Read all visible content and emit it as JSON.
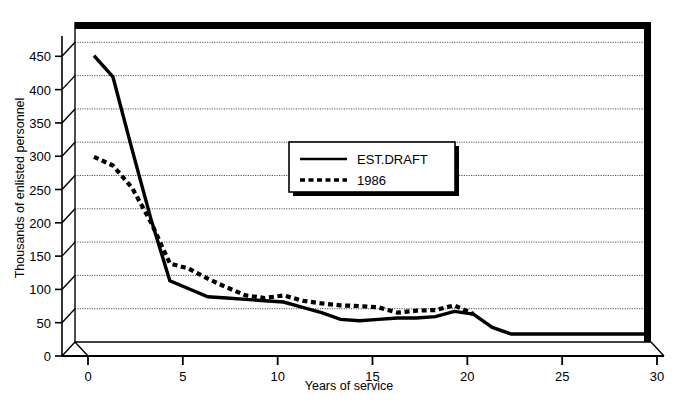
{
  "chart_data": {
    "type": "line",
    "title": "",
    "xlabel": "Years of service",
    "ylabel": "Thousands of enlisted personnel",
    "xlim": [
      0,
      30
    ],
    "ylim": [
      0,
      470
    ],
    "xticks": [
      "0",
      "5",
      "10",
      "15",
      "20",
      "25",
      "30"
    ],
    "yticks": [
      "0",
      "50",
      "100",
      "150",
      "200",
      "250",
      "300",
      "350",
      "400",
      "450"
    ],
    "grid": "horizontal",
    "legend_position": "upper-center",
    "x": [
      1,
      2,
      3,
      4,
      5,
      6,
      7,
      8,
      9,
      10,
      11,
      12,
      13,
      14,
      15,
      16,
      17,
      18,
      19,
      20,
      21,
      22,
      23,
      24,
      25,
      26,
      27,
      28,
      29,
      30
    ],
    "series": [
      {
        "name": "EST.DRAFT",
        "style": "solid",
        "color": "#000000",
        "values": [
          430,
          398,
          290,
          185,
          92,
          80,
          68,
          66,
          64,
          62,
          60,
          52,
          44,
          34,
          32,
          34,
          36,
          36,
          38,
          46,
          42,
          22,
          12,
          12,
          12,
          12,
          12,
          12,
          12,
          12
        ]
      },
      {
        "name": "1986",
        "style": "dotted",
        "color": "#000000",
        "values": [
          278,
          265,
          232,
          180,
          118,
          110,
          95,
          82,
          70,
          66,
          70,
          62,
          58,
          55,
          54,
          52,
          44,
          47,
          48,
          55,
          42,
          null,
          null,
          null,
          null,
          null,
          null,
          null,
          null,
          null
        ]
      }
    ]
  },
  "legend": {
    "items": [
      {
        "label": "EST.DRAFT",
        "style": "solid"
      },
      {
        "label": "1986",
        "style": "dotted"
      }
    ]
  },
  "axes": {
    "x_title": "Years of service",
    "y_title": "Thousands of enlisted personnel",
    "x_tick_labels": [
      "0",
      "5",
      "10",
      "15",
      "20",
      "25",
      "30"
    ],
    "y_tick_labels": [
      "0",
      "50",
      "100",
      "150",
      "200",
      "250",
      "300",
      "350",
      "400",
      "450"
    ]
  },
  "colors": {
    "line": "#000000",
    "grid": "#555555",
    "background": "#ffffff",
    "frame": "#000000"
  }
}
